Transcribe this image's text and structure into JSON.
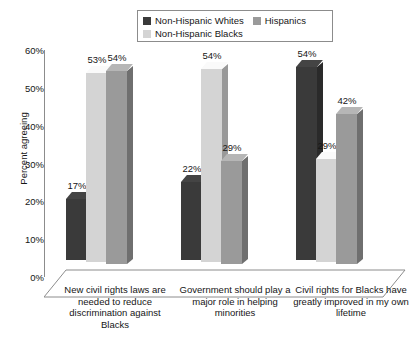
{
  "legend": {
    "items": [
      {
        "label": "Non-Hispanic Whites",
        "color": "#3a3a3a",
        "key": "whites"
      },
      {
        "label": "Hispanics",
        "color": "#9a9a9a",
        "key": "hispanics"
      },
      {
        "label": "Non-Hispanic Blacks",
        "color": "#d4d4d4",
        "key": "blacks"
      }
    ]
  },
  "axis": {
    "ylabel": "Percent agreeing",
    "yticks": [
      "60%",
      "50%",
      "40%",
      "30%",
      "20%",
      "10%",
      "0%"
    ]
  },
  "caption": "",
  "chart_data": {
    "type": "bar",
    "title": "",
    "xlabel": "",
    "ylabel": "Percent agreeing",
    "ylim": [
      0,
      60
    ],
    "ytick_values": [
      0,
      10,
      20,
      30,
      40,
      50,
      60
    ],
    "grid": false,
    "legend_position": "top",
    "three_d": true,
    "categories": [
      "New civil rights laws are needed to reduce discrimination against Blacks",
      "Government should play a major role in helping minorities",
      "Civil rights for Blacks have greatly improved in my own lifetime"
    ],
    "series": [
      {
        "name": "Non-Hispanic Whites",
        "color": "#3a3a3a",
        "values": [
          17,
          22,
          54
        ],
        "labels": [
          "17%",
          "22%",
          "54%"
        ]
      },
      {
        "name": "Non-Hispanic Blacks",
        "color": "#d4d4d4",
        "values": [
          53,
          54,
          29
        ],
        "labels": [
          "53%",
          "54%",
          "29%"
        ]
      },
      {
        "name": "Hispanics",
        "color": "#9a9a9a",
        "values": [
          54,
          29,
          42
        ],
        "labels": [
          "54%",
          "29%",
          "42%"
        ]
      }
    ],
    "plot_order": [
      "Non-Hispanic Whites",
      "Non-Hispanic Blacks",
      "Hispanics"
    ]
  }
}
